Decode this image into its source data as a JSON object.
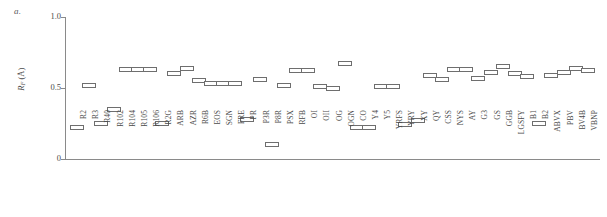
{
  "panel": {
    "label": "a."
  },
  "axes": {
    "y_title_main": "R",
    "y_title_sub": "F",
    "y_title_unit": " (Å)",
    "y_ticks": [
      "1.0",
      "0.5",
      "0"
    ],
    "y_tick_values": [
      1.0,
      0.5,
      0.0
    ]
  },
  "chart_data": {
    "type": "scatter",
    "title": "",
    "subtitle": "",
    "xlabel": "",
    "ylabel": "R_F (Å)",
    "ylim": [
      0,
      1.0
    ],
    "yticks": [
      0,
      0.5,
      1.0
    ],
    "grid": false,
    "legend": null,
    "marker_style": "open-rectangle",
    "panel_label": "a.",
    "categories": [
      "R2",
      "R3",
      "R40",
      "R102",
      "R104",
      "R105",
      "R106",
      "R2G",
      "ARB",
      "AZR",
      "R6B",
      "EOS",
      "SGN",
      "FRE",
      "PR",
      "P3R",
      "P8R",
      "PSX",
      "RFB",
      "OI",
      "OII",
      "OG",
      "OGN",
      "CO",
      "Y4",
      "Y5",
      "YRFS",
      "YRY",
      "XY",
      "QY",
      "CSS",
      "NYS",
      "AY",
      "G3",
      "GS",
      "GGB",
      "LGSFY",
      "B1",
      "B2",
      "ABVX",
      "PBV",
      "BV4B",
      "VBNP"
    ],
    "values": [
      0.22,
      0.52,
      0.25,
      0.35,
      0.63,
      0.63,
      0.63,
      0.25,
      0.6,
      0.64,
      0.55,
      0.53,
      0.53,
      0.53,
      0.28,
      0.56,
      0.1,
      0.52,
      0.62,
      0.62,
      0.51,
      0.5,
      0.67,
      0.22,
      0.22,
      0.51,
      0.51,
      0.24,
      0.27,
      0.59,
      0.56,
      0.63,
      0.63,
      0.57,
      0.61,
      0.65,
      0.6,
      0.58,
      0.25,
      0.59,
      0.61,
      0.64,
      0.62
    ]
  }
}
